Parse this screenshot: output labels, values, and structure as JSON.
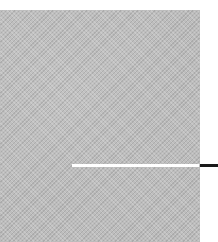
{
  "figure": {
    "panel": {
      "fill": "textured gray",
      "color": "#bdbdbd"
    },
    "marker_line": {
      "color": "#ffffff"
    },
    "leader_line": {
      "color": "#1a1a1a"
    }
  }
}
